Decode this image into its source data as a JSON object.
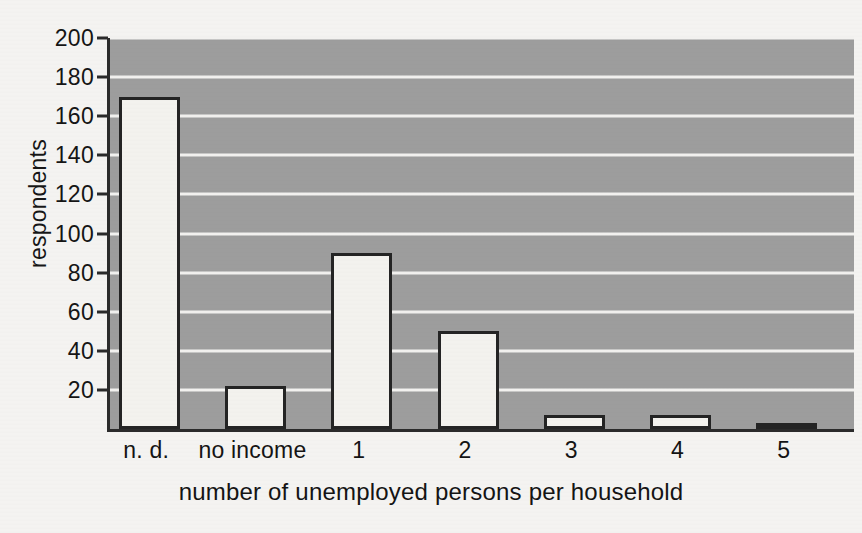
{
  "chart_data": {
    "type": "bar",
    "title": "",
    "categories": [
      "n. d.",
      "no income",
      "1",
      "2",
      "3",
      "4",
      "5"
    ],
    "values": [
      170,
      22,
      90,
      50,
      7,
      7,
      3
    ],
    "xlabel": "number of unemployed persons per household",
    "ylabel": "respondents",
    "ylim": [
      0,
      200
    ],
    "ytick_labels": [
      "20",
      "40",
      "60",
      "80",
      "100",
      "120",
      "140",
      "160",
      "180",
      "200"
    ],
    "ytick_values": [
      20,
      40,
      60,
      80,
      100,
      120,
      140,
      160,
      180,
      200
    ],
    "grid": true,
    "legend": "none",
    "colors": {
      "plot_background": "#9d9d9d",
      "gridline": "#f2f1ef",
      "bar_fill": "#f3f2ee",
      "bar_outline": "#242424",
      "axis": "#2b2b2b",
      "text": "#141414",
      "page_background": "#f4f3f1"
    }
  }
}
